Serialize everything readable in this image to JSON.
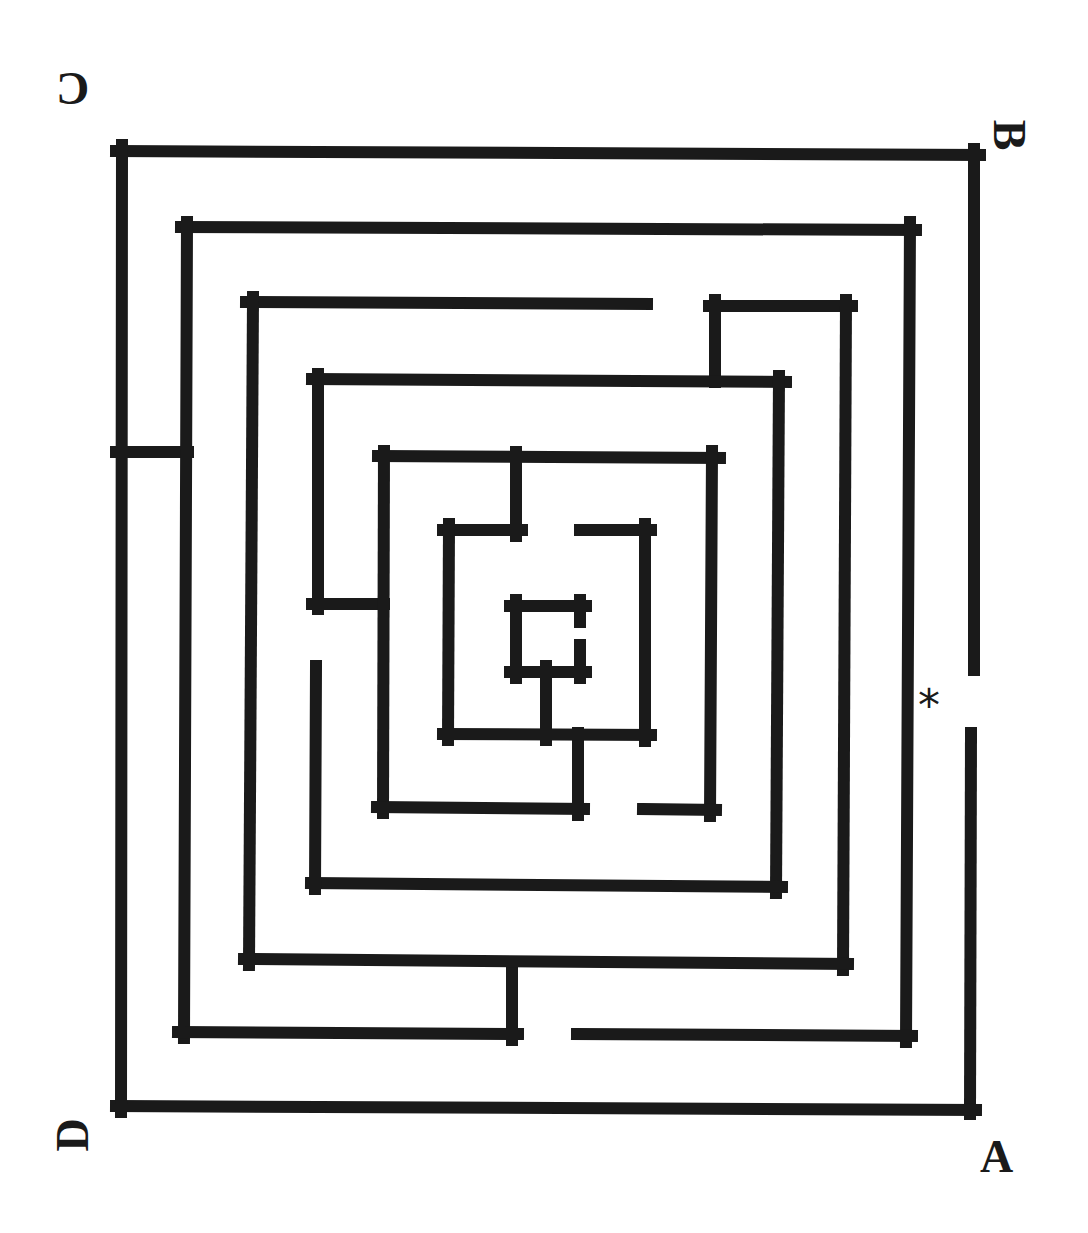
{
  "maze": {
    "wall_color": "#1a1a1a",
    "background_color": "#ffffff",
    "wall_thickness": 12,
    "labels": {
      "top_left": "C",
      "top_right": "B",
      "bottom_left": "D",
      "bottom_right": "A"
    },
    "marker": "*",
    "walls": [
      {
        "id": "outer-top",
        "x1": 116,
        "y1": 151,
        "x2": 980,
        "y2": 155
      },
      {
        "id": "outer-right-upper",
        "x1": 974,
        "y1": 149,
        "x2": 974,
        "y2": 670
      },
      {
        "id": "outer-right-lower",
        "x1": 971,
        "y1": 733,
        "x2": 970,
        "y2": 1114
      },
      {
        "id": "outer-bottom",
        "x1": 116,
        "y1": 1106,
        "x2": 976,
        "y2": 1110
      },
      {
        "id": "outer-left",
        "x1": 122,
        "y1": 145,
        "x2": 121,
        "y2": 1112
      },
      {
        "id": "outer-left-stub",
        "x1": 116,
        "y1": 452,
        "x2": 188,
        "y2": 452
      },
      {
        "id": "ring2-top",
        "x1": 181,
        "y1": 227,
        "x2": 916,
        "y2": 230
      },
      {
        "id": "ring2-right",
        "x1": 910,
        "y1": 222,
        "x2": 906,
        "y2": 1042
      },
      {
        "id": "ring2-bottom-right",
        "x1": 577,
        "y1": 1034,
        "x2": 912,
        "y2": 1036
      },
      {
        "id": "ring2-left",
        "x1": 187,
        "y1": 222,
        "x2": 184,
        "y2": 1038
      },
      {
        "id": "ring2-bottom-left",
        "x1": 178,
        "y1": 1032,
        "x2": 518,
        "y2": 1034
      },
      {
        "id": "ring2-bottom-stub",
        "x1": 512,
        "y1": 962,
        "x2": 512,
        "y2": 1040
      },
      {
        "id": "ring3-top-left",
        "x1": 246,
        "y1": 302,
        "x2": 647,
        "y2": 304
      },
      {
        "id": "ring3-hook-vertical",
        "x1": 715,
        "y1": 300,
        "x2": 715,
        "y2": 382
      },
      {
        "id": "ring3-top-right",
        "x1": 709,
        "y1": 306,
        "x2": 852,
        "y2": 306
      },
      {
        "id": "ring3-right",
        "x1": 846,
        "y1": 300,
        "x2": 843,
        "y2": 970
      },
      {
        "id": "ring3-bottom",
        "x1": 244,
        "y1": 959,
        "x2": 848,
        "y2": 964
      },
      {
        "id": "ring3-left",
        "x1": 253,
        "y1": 297,
        "x2": 249,
        "y2": 965
      },
      {
        "id": "ring4-top",
        "x1": 312,
        "y1": 379,
        "x2": 786,
        "y2": 382
      },
      {
        "id": "ring4-right",
        "x1": 779,
        "y1": 376,
        "x2": 776,
        "y2": 893
      },
      {
        "id": "ring4-bottom",
        "x1": 311,
        "y1": 883,
        "x2": 782,
        "y2": 887
      },
      {
        "id": "ring4-left-upper",
        "x1": 318,
        "y1": 374,
        "x2": 318,
        "y2": 609
      },
      {
        "id": "ring4-left-stub",
        "x1": 312,
        "y1": 604,
        "x2": 384,
        "y2": 604
      },
      {
        "id": "ring4-left-lower",
        "x1": 316,
        "y1": 666,
        "x2": 315,
        "y2": 889
      },
      {
        "id": "ring5-top",
        "x1": 378,
        "y1": 456,
        "x2": 720,
        "y2": 458
      },
      {
        "id": "ring5-right",
        "x1": 712,
        "y1": 451,
        "x2": 710,
        "y2": 816
      },
      {
        "id": "ring5-bottom-right",
        "x1": 643,
        "y1": 809,
        "x2": 716,
        "y2": 810
      },
      {
        "id": "ring5-left",
        "x1": 384,
        "y1": 451,
        "x2": 383,
        "y2": 813
      },
      {
        "id": "ring5-bottom-left",
        "x1": 377,
        "y1": 807,
        "x2": 584,
        "y2": 809
      },
      {
        "id": "ring5-bottom-stub",
        "x1": 578,
        "y1": 733,
        "x2": 578,
        "y2": 815
      },
      {
        "id": "ring6-top-stem",
        "x1": 516,
        "y1": 452,
        "x2": 516,
        "y2": 536
      },
      {
        "id": "ring6-top-left",
        "x1": 443,
        "y1": 530,
        "x2": 522,
        "y2": 530
      },
      {
        "id": "ring6-left",
        "x1": 449,
        "y1": 524,
        "x2": 448,
        "y2": 740
      },
      {
        "id": "ring6-bottom",
        "x1": 443,
        "y1": 734,
        "x2": 651,
        "y2": 735
      },
      {
        "id": "ring6-right",
        "x1": 645,
        "y1": 524,
        "x2": 645,
        "y2": 741
      },
      {
        "id": "ring6-top-right",
        "x1": 580,
        "y1": 530,
        "x2": 651,
        "y2": 530
      },
      {
        "id": "center-top",
        "x1": 510,
        "y1": 606,
        "x2": 586,
        "y2": 606
      },
      {
        "id": "center-left",
        "x1": 516,
        "y1": 600,
        "x2": 516,
        "y2": 678
      },
      {
        "id": "center-bottom",
        "x1": 510,
        "y1": 672,
        "x2": 586,
        "y2": 672
      },
      {
        "id": "center-right-upper",
        "x1": 580,
        "y1": 600,
        "x2": 580,
        "y2": 622
      },
      {
        "id": "center-right-lower",
        "x1": 580,
        "y1": 645,
        "x2": 580,
        "y2": 678
      },
      {
        "id": "center-stem",
        "x1": 546,
        "y1": 666,
        "x2": 546,
        "y2": 740
      }
    ]
  }
}
